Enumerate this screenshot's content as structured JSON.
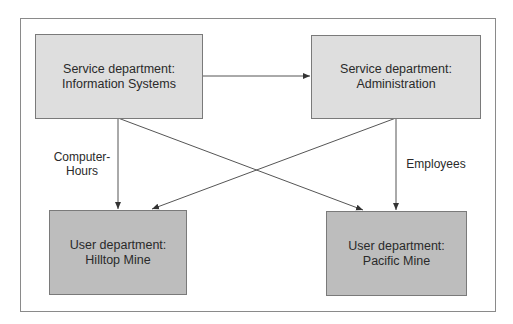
{
  "diagram": {
    "nodes": {
      "info_systems": {
        "line1": "Service department:",
        "line2": "Information Systems"
      },
      "administration": {
        "line1": "Service department:",
        "line2": "Administration"
      },
      "hilltop": {
        "line1": "User department:",
        "line2": "Hilltop Mine"
      },
      "pacific": {
        "line1": "User department:",
        "line2": "Pacific Mine"
      }
    },
    "edge_labels": {
      "computer_hours_line1": "Computer-",
      "computer_hours_line2": "Hours",
      "employees": "Employees"
    },
    "edges": [
      {
        "from": "info_systems",
        "to": "administration"
      },
      {
        "from": "info_systems",
        "to": "hilltop",
        "label": "Computer-Hours"
      },
      {
        "from": "info_systems",
        "to": "pacific"
      },
      {
        "from": "administration",
        "to": "hilltop"
      },
      {
        "from": "administration",
        "to": "pacific",
        "label": "Employees"
      }
    ],
    "colors": {
      "service_fill": "#dedede",
      "user_fill": "#bdbdbd",
      "line": "#555555"
    }
  }
}
